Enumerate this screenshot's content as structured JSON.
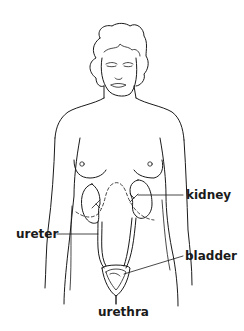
{
  "diagram": {
    "labels": {
      "kidney": "kidney",
      "ureter": "ureter",
      "bladder": "bladder",
      "urethra": "urethra"
    },
    "colors": {
      "line": "#1a1a1a",
      "background": "#ffffff"
    }
  }
}
